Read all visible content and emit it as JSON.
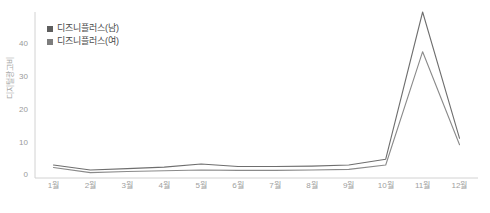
{
  "chart_data": {
    "type": "line",
    "title": "",
    "subtitle": "",
    "xlabel": "",
    "ylabel": "디지털광고비",
    "categories": [
      "1월",
      "2월",
      "3월",
      "4월",
      "5월",
      "6월",
      "7월",
      "8월",
      "9월",
      "10월",
      "11월",
      "12월"
    ],
    "ylim": [
      0,
      46
    ],
    "yticks": [
      0,
      10,
      20,
      30,
      40
    ],
    "ytick_labels": [
      "0",
      "10",
      "20",
      "30",
      "40"
    ],
    "grid": false,
    "legend_position": "top-left",
    "series": [
      {
        "name": "디즈니플러스(남)",
        "color": "#6e6e6e",
        "values": [
          3.6,
          2.2,
          2.6,
          3.0,
          3.9,
          3.2,
          3.2,
          3.3,
          3.6,
          5.2,
          46.0,
          11.0
        ]
      },
      {
        "name": "디즈니플러스(여)",
        "color": "#8a8a8a",
        "values": [
          2.9,
          1.5,
          1.8,
          2.0,
          2.2,
          2.1,
          2.1,
          2.2,
          2.4,
          3.6,
          35.0,
          9.2
        ]
      }
    ]
  },
  "legend": {
    "items": [
      {
        "label": "디즈니플러스(남)",
        "swatch_color": "#5e5e5e"
      },
      {
        "label": "디즈니플러스(여)",
        "swatch_color": "#7d7d7d"
      }
    ]
  },
  "axes": {
    "y_title": "디지털광고비",
    "y_tick_labels": [
      "40",
      "30",
      "20",
      "10",
      "0"
    ],
    "x_tick_labels": [
      "1월",
      "2월",
      "3월",
      "4월",
      "5월",
      "6월",
      "7월",
      "8월",
      "9월",
      "10월",
      "11월",
      "12월"
    ]
  },
  "colors": {
    "axis_line": "#d2d2d2",
    "tick_text": "#a0a0a0",
    "series_male": "#6e6e6e",
    "series_female": "#8a8a8a",
    "background": "#ffffff"
  }
}
